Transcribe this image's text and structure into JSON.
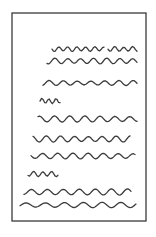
{
  "figure": {
    "width": 156,
    "height": 237,
    "background_color": "#ffffff",
    "ink_color": "#3c3c3c",
    "page": {
      "x": 12,
      "y": 13,
      "width": 134,
      "height": 208,
      "border_color": "#3a3a3a"
    },
    "text_lines": [
      {
        "segments": [
          [
            52,
            104
          ],
          [
            108,
            137
          ]
        ],
        "y": 49,
        "amplitude": 2.2,
        "wavelength": 9
      },
      {
        "segments": [
          [
            47,
            137
          ]
        ],
        "y": 61,
        "amplitude": 2.6,
        "wavelength": 13
      },
      {
        "segments": [
          [
            43,
            137
          ]
        ],
        "y": 83,
        "amplitude": 2.2,
        "wavelength": 14
      },
      {
        "segments": [
          [
            40,
            60
          ]
        ],
        "y": 101,
        "amplitude": 2.4,
        "wavelength": 7
      },
      {
        "segments": [
          [
            38,
            137
          ]
        ],
        "y": 119,
        "amplitude": 2.8,
        "wavelength": 15
      },
      {
        "segments": [
          [
            33,
            130
          ]
        ],
        "y": 139,
        "amplitude": 2.8,
        "wavelength": 14
      },
      {
        "segments": [
          [
            31,
            135
          ]
        ],
        "y": 156,
        "amplitude": 2.6,
        "wavelength": 15
      },
      {
        "segments": [
          [
            28,
            58
          ]
        ],
        "y": 174,
        "amplitude": 2.4,
        "wavelength": 9
      },
      {
        "segments": [
          [
            24,
            131
          ]
        ],
        "y": 192,
        "amplitude": 2.8,
        "wavelength": 16
      },
      {
        "segments": [
          [
            20,
            136
          ]
        ],
        "y": 205,
        "amplitude": 2.4,
        "wavelength": 19
      }
    ]
  }
}
